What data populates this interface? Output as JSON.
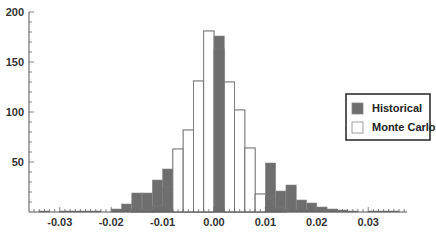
{
  "chart_data": {
    "type": "bar",
    "title": "",
    "xlabel": "",
    "ylabel": "",
    "xlim": [
      -0.036,
      0.037
    ],
    "ylim": [
      0,
      200
    ],
    "bin_width": 0.002,
    "grid": false,
    "legend_position": "right",
    "x_ticks": [
      -0.03,
      -0.02,
      -0.01,
      0.0,
      0.01,
      0.02,
      0.03
    ],
    "x_tick_labels": [
      "-0.03",
      "-0.02",
      "-0.01",
      "0.00",
      "0.01",
      "0.02",
      "0.03"
    ],
    "y_ticks": [
      50,
      100,
      150,
      200
    ],
    "y_tick_labels": [
      "50",
      "100",
      "150",
      "200"
    ],
    "bin_starts": [
      -0.036,
      -0.034,
      -0.032,
      -0.03,
      -0.028,
      -0.026,
      -0.024,
      -0.022,
      -0.02,
      -0.018,
      -0.016,
      -0.014,
      -0.012,
      -0.01,
      -0.008,
      -0.006,
      -0.004,
      -0.002,
      0.0,
      0.002,
      0.004,
      0.006,
      0.008,
      0.01,
      0.012,
      0.014,
      0.016,
      0.018,
      0.02,
      0.022,
      0.024,
      0.026,
      0.028,
      0.03,
      0.032,
      0.034
    ],
    "series": [
      {
        "name": "Historical",
        "color": "#6e6e6e",
        "values": [
          0,
          1,
          0,
          1,
          1,
          1,
          1,
          0,
          3,
          8,
          19,
          19,
          32,
          43,
          0,
          0,
          0,
          0,
          176,
          0,
          0,
          0,
          0,
          49,
          21,
          27,
          12,
          9,
          5,
          3,
          2,
          1,
          0,
          1,
          1,
          1
        ]
      },
      {
        "name": "Monte Carlo",
        "color": "#ffffff",
        "values": [
          0,
          0,
          0,
          0,
          0,
          0,
          0,
          0,
          0,
          0,
          1,
          2,
          6,
          25,
          63,
          82,
          131,
          181,
          163,
          130,
          102,
          64,
          18,
          15,
          5,
          0,
          0,
          0,
          0,
          0,
          0,
          0,
          0,
          0,
          0,
          0
        ]
      }
    ]
  },
  "legend": {
    "items": [
      {
        "label": "Historical",
        "color": "#6e6e6e"
      },
      {
        "label": "Monte Carlo",
        "color": "#ffffff"
      }
    ]
  }
}
